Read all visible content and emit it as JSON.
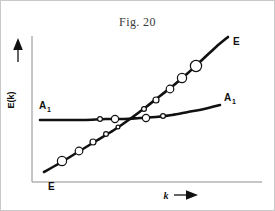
{
  "figure": {
    "title": "Fig. 20",
    "background_color": "#ffffff",
    "frame_color": "#c9c9c9",
    "width": 275,
    "height": 211
  },
  "axes": {
    "line_color": "#8e8e8e",
    "y_axis_label": "E(k)",
    "y_axis_arrow_icon": "arrow-up-icon",
    "x_axis_label": "k",
    "x_axis_arrow_icon": "arrow-right-icon",
    "origin_x": 32,
    "origin_y": 182,
    "x_axis_end": 262,
    "y_axis_top": 36
  },
  "labels": {
    "e_top_right": "E",
    "e_bottom_left": "E",
    "a_left_base": "A",
    "a_left_sub": "1",
    "a_right_base": "A",
    "a_right_sub": "1"
  },
  "chart_data": {
    "type": "line",
    "title": "Fig. 20",
    "xlabel": "k",
    "ylabel": "E(k)",
    "grid": false,
    "legend_position": "inline-curve-ends",
    "axis_style": "arrow-axes-no-ticks",
    "xlim": [
      0,
      1
    ],
    "ylim": [
      0,
      1
    ],
    "curve_color": "#111111",
    "marker_style": "open-circle",
    "marker_fill": "#ffffff",
    "series": [
      {
        "name": "E",
        "label_start": "E",
        "label_end": "E",
        "description": "steeply rising nearly linear band, slightly convex upward",
        "points_px": [
          [
            44,
            172
          ],
          [
            60,
            163
          ],
          [
            78,
            152
          ],
          [
            96,
            141
          ],
          [
            114,
            130
          ],
          [
            130,
            119
          ],
          [
            146,
            107
          ],
          [
            160,
            96
          ],
          [
            174,
            85
          ],
          [
            188,
            73
          ],
          [
            202,
            60
          ],
          [
            216,
            47
          ],
          [
            228,
            37
          ]
        ],
        "markers_px": [
          {
            "x": 62,
            "y": 161,
            "r": 4.6
          },
          {
            "x": 79,
            "y": 151,
            "r": 3.8
          },
          {
            "x": 93,
            "y": 142,
            "r": 3.0
          },
          {
            "x": 106,
            "y": 134,
            "r": 2.4
          },
          {
            "x": 118,
            "y": 127,
            "r": 1.9
          },
          {
            "x": 144,
            "y": 109,
            "r": 2.4
          },
          {
            "x": 156,
            "y": 100,
            "r": 3.0
          },
          {
            "x": 170,
            "y": 89,
            "r": 3.8
          },
          {
            "x": 182,
            "y": 78,
            "r": 4.6
          },
          {
            "x": 196,
            "y": 66,
            "r": 5.6
          }
        ]
      },
      {
        "name": "A1",
        "label_start": "A",
        "label_end": "A",
        "description": "nearly flat band, gently rising toward larger k",
        "points_px": [
          [
            40,
            120
          ],
          [
            62,
            120
          ],
          [
            84,
            120
          ],
          [
            106,
            119
          ],
          [
            124,
            119
          ],
          [
            140,
            118
          ],
          [
            156,
            117
          ],
          [
            172,
            115
          ],
          [
            188,
            112
          ],
          [
            204,
            109
          ],
          [
            220,
            105
          ]
        ],
        "markers_px": [
          {
            "x": 100,
            "y": 119,
            "r": 2.4
          },
          {
            "x": 115,
            "y": 119,
            "r": 3.6
          },
          {
            "x": 146,
            "y": 118,
            "r": 3.6
          },
          {
            "x": 163,
            "y": 116,
            "r": 2.4
          }
        ]
      }
    ],
    "crossing_point_px": [
      131,
      118
    ],
    "annotations": [
      {
        "text": "E",
        "x_px": 235,
        "y_px": 42,
        "series": "E"
      },
      {
        "text": "E",
        "x_px": 51,
        "y_px": 186,
        "series": "E"
      },
      {
        "text": "A",
        "sub": "1",
        "x_px": 42,
        "y_px": 106,
        "series": "A1"
      },
      {
        "text": "A",
        "sub": "1",
        "x_px": 226,
        "y_px": 98,
        "series": "A1"
      }
    ]
  }
}
